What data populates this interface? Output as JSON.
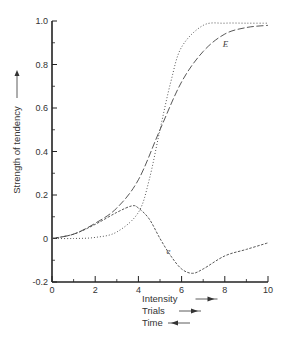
{
  "chart_data": {
    "type": "line",
    "title": "",
    "xlabel": "Intensity",
    "ylabel": "Strength of tendency",
    "xlabel_lines": [
      {
        "text": "Intensity",
        "arrow": "right"
      },
      {
        "text": "Trials",
        "arrow": "right"
      },
      {
        "text": "Time",
        "arrow": "left"
      }
    ],
    "xlim": [
      0,
      10
    ],
    "ylim": [
      -0.2,
      1.0
    ],
    "xticks": [
      0,
      2,
      4,
      6,
      8,
      10
    ],
    "xtick_labels": [
      "0",
      "2",
      "4",
      "6",
      "8",
      "10"
    ],
    "yticks": [
      -0.2,
      0,
      0.2,
      0.4,
      0.6,
      0.8,
      1.0
    ],
    "ytick_labels": [
      "-0.2",
      "0",
      "0.2",
      "0.4",
      "0.6",
      "0.8",
      "1.0"
    ],
    "grid": false,
    "legend": "none (inline curve labels)",
    "series": [
      {
        "name": "E",
        "style": "long-dash",
        "x": [
          0,
          1,
          2,
          3,
          4,
          5,
          6,
          7,
          8,
          9,
          10
        ],
        "values": [
          0,
          0.02,
          0.07,
          0.14,
          0.27,
          0.5,
          0.72,
          0.86,
          0.94,
          0.97,
          0.98
        ]
      },
      {
        "name": "",
        "style": "dotted",
        "x": [
          0,
          1,
          2,
          3,
          4,
          4.5,
          5,
          5.5,
          6,
          7,
          8,
          9,
          10
        ],
        "values": [
          0,
          0,
          0.005,
          0.03,
          0.12,
          0.27,
          0.5,
          0.72,
          0.88,
          0.98,
          0.99,
          0.99,
          0.99
        ]
      },
      {
        "name": "e",
        "style": "short-dash",
        "x": [
          0,
          1,
          2,
          3,
          3.7,
          4,
          4.5,
          5,
          5.5,
          6,
          6.5,
          7,
          8,
          9,
          10
        ],
        "values": [
          0,
          0.02,
          0.065,
          0.12,
          0.15,
          0.14,
          0.09,
          0.0,
          -0.08,
          -0.14,
          -0.16,
          -0.14,
          -0.08,
          -0.05,
          -0.02
        ]
      }
    ],
    "annotations": [
      {
        "text": "E",
        "x": 7.9,
        "y": 0.88
      },
      {
        "text": "e",
        "x": 5.3,
        "y": -0.07
      }
    ]
  }
}
